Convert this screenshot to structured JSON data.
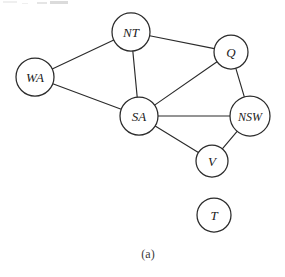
{
  "figure": {
    "caption": "(a)",
    "stroke_color": "#2b2b2b",
    "fill_color": "#ffffff",
    "label_color": "#1a1a1a"
  },
  "chart_data": {
    "type": "diagram",
    "title": "(a)",
    "subtitle": "",
    "xlabel": "",
    "ylabel": "",
    "graph_kind": "undirected-constraint-graph",
    "node_count": 7,
    "edge_count": 9,
    "nodes": [
      {
        "id": "WA",
        "label": "WA",
        "cx": 35,
        "cy": 77,
        "r": 19,
        "font_size": 13
      },
      {
        "id": "NT",
        "label": "NT",
        "cx": 131,
        "cy": 32,
        "r": 19,
        "font_size": 13
      },
      {
        "id": "Q",
        "label": "Q",
        "cx": 231,
        "cy": 52,
        "r": 17,
        "font_size": 13
      },
      {
        "id": "SA",
        "label": "SA",
        "cx": 139,
        "cy": 116,
        "r": 19,
        "font_size": 13
      },
      {
        "id": "NSW",
        "label": "NSW",
        "cx": 250,
        "cy": 116,
        "r": 20,
        "font_size": 12
      },
      {
        "id": "V",
        "label": "V",
        "cx": 212,
        "cy": 161,
        "r": 16,
        "font_size": 13
      },
      {
        "id": "T",
        "label": "T",
        "cx": 214,
        "cy": 215,
        "r": 17,
        "font_size": 13
      }
    ],
    "edges": [
      {
        "source": "WA",
        "target": "NT"
      },
      {
        "source": "WA",
        "target": "SA"
      },
      {
        "source": "NT",
        "target": "SA"
      },
      {
        "source": "NT",
        "target": "Q"
      },
      {
        "source": "SA",
        "target": "Q"
      },
      {
        "source": "SA",
        "target": "NSW"
      },
      {
        "source": "SA",
        "target": "V"
      },
      {
        "source": "Q",
        "target": "NSW"
      },
      {
        "source": "V",
        "target": "NSW"
      }
    ],
    "isolated_nodes": [
      "T"
    ],
    "caption_position": {
      "x": 148,
      "y": 254
    }
  }
}
